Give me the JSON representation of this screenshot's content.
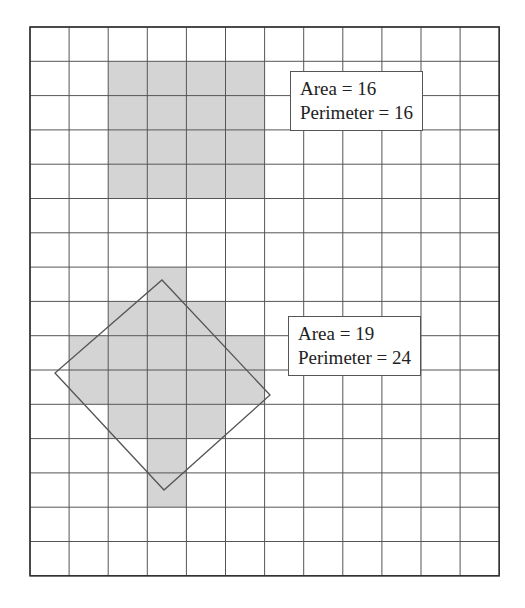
{
  "grid": {
    "cols": 12,
    "rows": 16,
    "x0": 30,
    "y0": 27,
    "cell_w": 39.1,
    "cell_h": 34.3,
    "line_color": "#555555",
    "border_color": "#333333"
  },
  "shade_color": "#d4d4d4",
  "figures": [
    {
      "name": "square",
      "cells": [
        [
          2,
          1
        ],
        [
          3,
          1
        ],
        [
          4,
          1
        ],
        [
          5,
          1
        ],
        [
          2,
          2
        ],
        [
          3,
          2
        ],
        [
          4,
          2
        ],
        [
          5,
          2
        ],
        [
          2,
          3
        ],
        [
          3,
          3
        ],
        [
          4,
          3
        ],
        [
          5,
          3
        ],
        [
          2,
          4
        ],
        [
          3,
          4
        ],
        [
          4,
          4
        ],
        [
          5,
          4
        ]
      ],
      "label": {
        "area": "Area = 16",
        "perimeter": "Perimeter = 16"
      }
    },
    {
      "name": "cross",
      "cells": [
        [
          3,
          7
        ],
        [
          2,
          8
        ],
        [
          3,
          8
        ],
        [
          4,
          8
        ],
        [
          1,
          9
        ],
        [
          2,
          9
        ],
        [
          3,
          9
        ],
        [
          4,
          9
        ],
        [
          5,
          9
        ],
        [
          1,
          10
        ],
        [
          2,
          10
        ],
        [
          3,
          10
        ],
        [
          4,
          10
        ],
        [
          5,
          10
        ],
        [
          2,
          11
        ],
        [
          3,
          11
        ],
        [
          4,
          11
        ],
        [
          3,
          12
        ],
        [
          3,
          13
        ]
      ],
      "label": {
        "area": "Area = 19",
        "perimeter": "Perimeter = 24"
      },
      "enclosing_square": [
        [
          162,
          280
        ],
        [
          270,
          395
        ],
        [
          164,
          490
        ],
        [
          55,
          373
        ]
      ]
    }
  ]
}
